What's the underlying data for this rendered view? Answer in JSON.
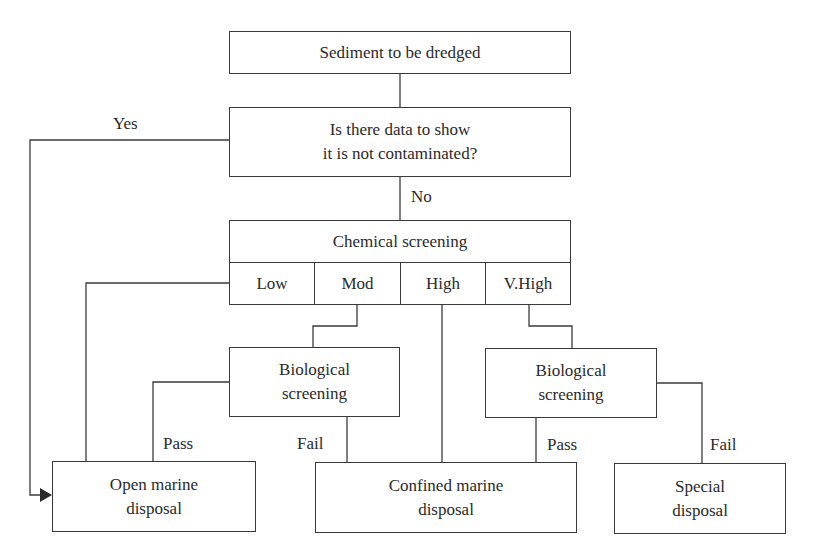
{
  "diagram": {
    "type": "flowchart",
    "nodes": {
      "start": {
        "label": "Sediment to be dredged"
      },
      "question": {
        "label": "Is there data to show\nit is not contaminated?"
      },
      "chemical": {
        "label": "Chemical screening",
        "levels": [
          "Low",
          "Mod",
          "High",
          "V.High"
        ]
      },
      "bio1": {
        "label": "Biological\nscreening"
      },
      "bio2": {
        "label": "Biological\nscreening"
      },
      "open_marine": {
        "label": "Open marine\ndisposal"
      },
      "confined_marine": {
        "label": "Confined marine\ndisposal"
      },
      "special": {
        "label": "Special\ndisposal"
      }
    },
    "edge_labels": {
      "yes": "Yes",
      "no": "No",
      "bio1_pass": "Pass",
      "bio1_fail": "Fail",
      "bio2_pass": "Pass",
      "bio2_fail": "Fail"
    },
    "edges": [
      {
        "from": "start",
        "to": "question"
      },
      {
        "from": "question",
        "to": "open_marine",
        "label": "Yes"
      },
      {
        "from": "question",
        "to": "chemical",
        "label": "No"
      },
      {
        "from": "chemical.Low",
        "to": "open_marine"
      },
      {
        "from": "chemical.Mod",
        "to": "bio1"
      },
      {
        "from": "chemical.High",
        "to": "confined_marine"
      },
      {
        "from": "chemical.V.High",
        "to": "bio2"
      },
      {
        "from": "bio1",
        "to": "open_marine",
        "label": "Pass"
      },
      {
        "from": "bio1",
        "to": "confined_marine",
        "label": "Fail"
      },
      {
        "from": "bio2",
        "to": "confined_marine",
        "label": "Pass"
      },
      {
        "from": "bio2",
        "to": "special",
        "label": "Fail"
      }
    ],
    "colors": {
      "line": "#3a3a3a",
      "text": "#2a2a2a",
      "background": "#ffffff"
    }
  }
}
